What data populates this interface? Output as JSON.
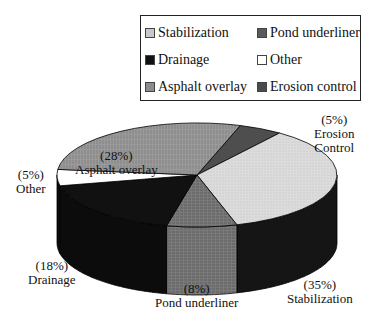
{
  "chart_data": {
    "type": "pie",
    "style": "3d",
    "title": "",
    "slices": [
      {
        "name": "Erosion control",
        "label_pct": "(5%)",
        "label_name": "Erosion\nControl",
        "value": 5,
        "color": "#5a5a5a"
      },
      {
        "name": "Stabilization",
        "label_pct": "(35%)",
        "label_name": "Stabilization",
        "value": 35,
        "color": "#d4d4d4"
      },
      {
        "name": "Pond underliner",
        "label_pct": "(8%)",
        "label_name": "Pond underliner",
        "value": 8,
        "color": "#6e6e6e"
      },
      {
        "name": "Drainage",
        "label_pct": "(18%)",
        "label_name": "Drainage",
        "value": 18,
        "color": "#111111"
      },
      {
        "name": "Other",
        "label_pct": "(5%)",
        "label_name": "Other",
        "value": 5,
        "color": "#ffffff"
      },
      {
        "name": "Asphalt overlay",
        "label_pct": "(28%)",
        "label_name": "Asphalt overlay",
        "value": 28,
        "color": "#8c8c8c"
      }
    ],
    "legend": {
      "position": "top-right",
      "columns": 2,
      "entries": [
        "Stabilization",
        "Pond underliner",
        "Drainage",
        "Other",
        "Asphalt overlay",
        "Erosion control"
      ]
    }
  },
  "legend": {
    "items": [
      {
        "label": "Stabilization",
        "color": "#c8c8c8"
      },
      {
        "label": "Pond underliner",
        "color": "#5a5a5a"
      },
      {
        "label": "Drainage",
        "color": "#111111"
      },
      {
        "label": "Other",
        "color": "#ffffff"
      },
      {
        "label": "Asphalt overlay",
        "color": "#8c8c8c"
      },
      {
        "label": "Erosion control",
        "color": "#4a4a4a"
      }
    ]
  },
  "labels": {
    "asphalt_pct": "(28%)",
    "asphalt_name": "Asphalt overlay",
    "other_pct": "(5%)",
    "other_name": "Other",
    "erosion_pct": "(5%)",
    "erosion_name1": "Erosion",
    "erosion_name2": "Control",
    "drainage_pct": "(18%)",
    "drainage_name": "Drainage",
    "pond_pct": "(8%)",
    "pond_name": "Pond underliner",
    "stab_pct": "(35%)",
    "stab_name": "Stabilization"
  }
}
